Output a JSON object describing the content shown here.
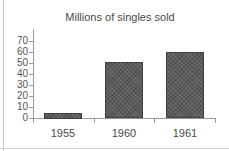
{
  "chart_data": {
    "type": "bar",
    "title": "Millions of singles sold",
    "xlabel": "",
    "ylabel": "",
    "categories": [
      "1955",
      "1960",
      "1961"
    ],
    "values": [
      5,
      51,
      60
    ],
    "ylim": [
      0,
      70
    ],
    "yticks": [
      0,
      10,
      20,
      30,
      40,
      50,
      60,
      70
    ],
    "ytick_labels": [
      "0",
      "10",
      "20",
      "30",
      "40",
      "50",
      "60",
      "70"
    ],
    "grid": false,
    "legend": "none",
    "bar_color": "#5c5c5c",
    "bar_edge_color": "#3f3f3f",
    "axis_color": "#9a9a9a",
    "text_color": "#4a4a4a",
    "background": "#ffffff"
  }
}
